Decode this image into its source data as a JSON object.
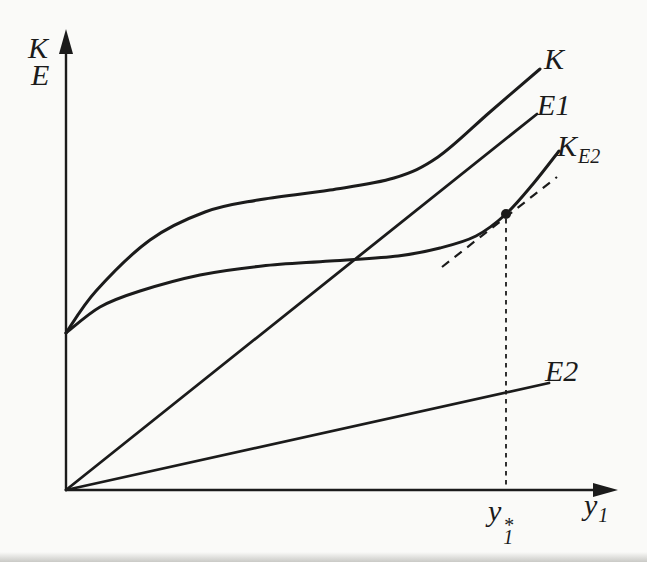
{
  "figure": {
    "background": "#fafaf8",
    "ink": "#1b1b1b",
    "width_px": 647,
    "height_px": 562
  },
  "labels": {
    "axis_k": "K",
    "axis_e": "E",
    "curve_k": "K",
    "curve_e1": "E1",
    "curve_ke2_main": "K",
    "curve_ke2_sub": "E2",
    "curve_e2": "E2",
    "xaxis_main": "y",
    "xaxis_sub": "1",
    "xstar_main": "y",
    "xstar_sub": "1",
    "xstar_sup": "*"
  },
  "chart_data": {
    "type": "line",
    "title": "",
    "xlabel": "y1",
    "ylabel": "K, E",
    "grid": false,
    "tick_labels": [],
    "coords_note": "pixel coordinates, y-down; axes origin at [66,490]; no numeric scale shown",
    "x_marker": {
      "label": "y1*",
      "fraction_of_x_axis": 0.8
    },
    "series": [
      {
        "name": "K",
        "kind": "smooth",
        "stroke_width": 3,
        "points": [
          [
            66,
            333
          ],
          [
            96,
            291
          ],
          [
            150,
            240
          ],
          [
            205,
            212
          ],
          [
            258,
            200
          ],
          [
            330,
            190
          ],
          [
            394,
            178
          ],
          [
            438,
            157
          ],
          [
            490,
            112
          ],
          [
            540,
            69
          ]
        ]
      },
      {
        "name": "E1",
        "kind": "straight",
        "stroke_width": 2.8,
        "points": [
          [
            66,
            490
          ],
          [
            537,
            114
          ]
        ]
      },
      {
        "name": "KE2",
        "kind": "smooth",
        "stroke_width": 3,
        "points": [
          [
            66,
            333
          ],
          [
            100,
            307
          ],
          [
            140,
            291
          ],
          [
            200,
            275
          ],
          [
            262,
            266
          ],
          [
            330,
            261
          ],
          [
            398,
            256
          ],
          [
            440,
            248
          ],
          [
            476,
            236
          ],
          [
            506,
            214
          ],
          [
            533,
            184
          ],
          [
            559,
            151
          ]
        ]
      },
      {
        "name": "E2",
        "kind": "straight",
        "stroke_width": 2.8,
        "points": [
          [
            66,
            490
          ],
          [
            549,
            383
          ]
        ]
      }
    ],
    "axes": {
      "y_axis": {
        "line": [
          [
            66,
            490
          ],
          [
            66,
            54
          ]
        ],
        "arrow_tip": [
          66,
          29
        ],
        "stroke_width": 2.4
      },
      "x_axis": {
        "line": [
          [
            66,
            490
          ],
          [
            594,
            490
          ]
        ],
        "arrow_tip": [
          618,
          490
        ],
        "stroke_width": 2.4
      }
    },
    "dashed": [
      {
        "name": "tangent-at-y1star",
        "points": [
          [
            442,
            267
          ],
          [
            557,
            177
          ]
        ],
        "dash": "9 7",
        "stroke_width": 2.2
      },
      {
        "name": "drop-line-y1star",
        "points": [
          [
            506,
            219
          ],
          [
            506,
            489
          ]
        ],
        "dash": "4.5 4.5",
        "stroke_width": 1.8
      }
    ],
    "marker_point": {
      "x": 506,
      "y": 214,
      "r": 5
    },
    "annotations": [
      "filled dot on KE2 curve at x = y1*",
      "short dashed line tangent to KE2 at the dot, parallel to E1",
      "dotted vertical drop line from the dot to the x-axis at y1*"
    ]
  }
}
